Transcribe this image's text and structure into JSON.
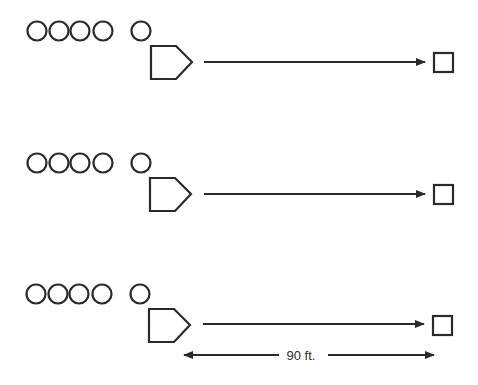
{
  "diagram": {
    "type": "drill-lineup",
    "rows": [
      {
        "waiting_players": 4,
        "active_player": 1,
        "base": "home-plate",
        "target": "base",
        "arrow": "throw-direction"
      },
      {
        "waiting_players": 4,
        "active_player": 1,
        "base": "home-plate",
        "target": "base",
        "arrow": "throw-direction"
      },
      {
        "waiting_players": 4,
        "active_player": 1,
        "base": "home-plate",
        "target": "base",
        "arrow": "throw-direction"
      }
    ],
    "dimension": {
      "label": "90 ft."
    },
    "colors": {
      "stroke": "#2a2a2a",
      "background": "#ffffff"
    }
  }
}
